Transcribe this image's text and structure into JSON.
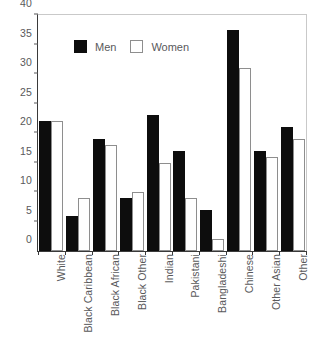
{
  "chart_data": {
    "type": "bar",
    "title": "",
    "subtitle": "",
    "xlabel": "",
    "ylabel": "",
    "ylim": [
      0,
      40
    ],
    "ytick_step": 5,
    "yticks": [
      "0",
      "5",
      "10",
      "15",
      "20",
      "25",
      "30",
      "35",
      "40"
    ],
    "grid": false,
    "legend_position": "top-left-inside",
    "categories": [
      "White",
      "Black Caribbean",
      "Black African",
      "Black Other",
      "Indian",
      "Pakistani",
      "Bangladeshi",
      "Chinese",
      "Other Asian",
      "Other"
    ],
    "series": [
      {
        "name": "Men",
        "color": "#0d0d0d",
        "values": [
          22,
          6,
          19,
          9,
          23,
          17,
          7,
          37.5,
          17,
          21
        ]
      },
      {
        "name": "Women",
        "color": "#ffffff",
        "edge_color": "#8e8e8e",
        "values": [
          22,
          9,
          18,
          10,
          15,
          9,
          2,
          31,
          16,
          19
        ]
      }
    ]
  },
  "legend": {
    "entries": [
      {
        "label": "Men",
        "swatch": "filled-square-icon"
      },
      {
        "label": "Women",
        "swatch": "outlined-square-icon"
      }
    ]
  },
  "axes": {
    "y_axis_color": "#3a3a3a",
    "x_axis_color": "#3a3a3a",
    "tick_label_color": "#59595b",
    "frame_color": "#c9c9c9"
  }
}
